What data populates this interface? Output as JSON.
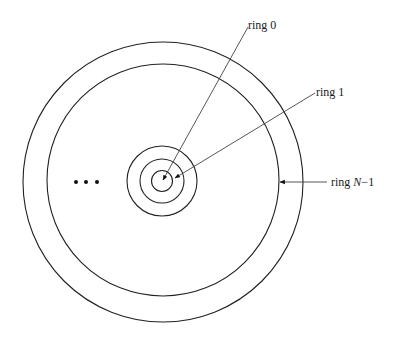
{
  "diagram": {
    "type": "concentric-rings",
    "labels": {
      "ring0": "ring 0",
      "ring1": "ring 1",
      "ringN_prefix": "ring ",
      "ringN_var": "N",
      "ringN_suffix": "−1"
    },
    "ellipsis": "...",
    "center": [
      162,
      181
    ],
    "rings_radii": [
      10,
      21,
      35,
      117,
      140
    ],
    "colors": {
      "stroke": "#222222",
      "leader": "#444444",
      "background": "#ffffff"
    }
  }
}
